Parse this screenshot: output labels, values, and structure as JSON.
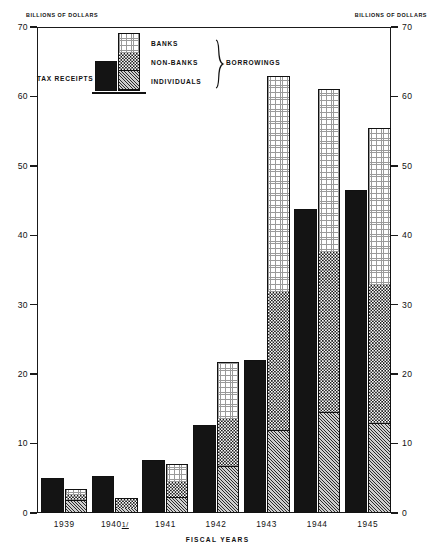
{
  "chart_data": {
    "type": "bar",
    "title": "",
    "xlabel": "FISCAL YEARS",
    "ylabel": "BILLIONS OF DOLLARS",
    "ylim": [
      0,
      70
    ],
    "yticks": [
      0,
      10,
      20,
      30,
      40,
      50,
      60,
      70
    ],
    "grid": false,
    "legend_position": "top-left-inside",
    "axis_caption_left": "BILLIONS OF DOLLARS",
    "axis_caption_right": "BILLIONS OF DOLLARS",
    "categories": [
      "1939",
      "1940",
      "1941",
      "1942",
      "1943",
      "1944",
      "1945"
    ],
    "category_labels": [
      "1939",
      "1940 1/",
      "1941",
      "1942",
      "1943",
      "1944",
      "1945"
    ],
    "series": [
      {
        "name": "TAX RECEIPTS",
        "group": "receipts",
        "values": [
          5.0,
          5.3,
          7.6,
          12.7,
          22.0,
          43.8,
          46.5
        ]
      },
      {
        "name": "INDIVIDUALS",
        "group": "borrowings",
        "values": [
          1.9,
          0.9,
          2.3,
          6.7,
          12.0,
          14.5,
          13.0
        ]
      },
      {
        "name": "NON-BANKS",
        "group": "borrowings",
        "values": [
          0.8,
          1.2,
          2.3,
          7.0,
          20.0,
          23.3,
          20.0
        ]
      },
      {
        "name": "BANKS",
        "group": "borrowings",
        "values": [
          0.7,
          0.0,
          2.4,
          8.0,
          31.0,
          23.3,
          22.5
        ]
      }
    ],
    "borrowings_totals": [
      3.4,
      2.1,
      7.0,
      21.7,
      63.0,
      61.1,
      55.5
    ],
    "segment_order_bottom_to_top": [
      "INDIVIDUALS",
      "NON-BANKS",
      "BANKS"
    ],
    "patterns": {
      "TAX RECEIPTS": "solid-black",
      "BANKS": "fine-dotted-light",
      "NON-BANKS": "checkerboard",
      "INDIVIDUALS": "diagonal-hatch-gray"
    },
    "colors": {
      "tax_receipts": "#141414",
      "banks": "#d9d9d9",
      "non_banks": "#8c8c8c",
      "individuals": "#b5b5b5",
      "axis": "#1a1a1a",
      "background": "#ffffff"
    }
  },
  "legend": {
    "tax_receipts_label": "TAX RECEIPTS",
    "banks_label": "BANKS",
    "non_banks_label": "NON-BANKS",
    "individuals_label": "INDIVIDUALS",
    "borrowings_label": "BORROWINGS"
  },
  "footnote": "1/"
}
